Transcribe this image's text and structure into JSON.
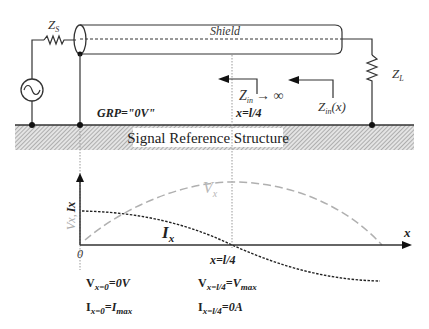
{
  "circuit": {
    "source_impedance_label": "Z",
    "source_impedance_sub": "S",
    "load_impedance_label": "Z",
    "load_impedance_sub": "L",
    "shield_label": "Shield",
    "ground_label": "GRP=\"0V\"",
    "reference_label": "Signal Reference Structure",
    "zin_inf_main": "Z",
    "zin_inf_sub": "in",
    "zin_inf_suffix": "→ ∞",
    "quarter_label": "x=l/4",
    "zin_x_main": "Z",
    "zin_x_sub": "in",
    "zin_x_suffix": "(x)"
  },
  "graph": {
    "y_axis_label_v": "Vx,",
    "y_axis_label_i": "Ix",
    "x_axis_label": "x",
    "origin_label": "0",
    "quarter_tick_label": "x=l/4",
    "curve_v_label_main": "V",
    "curve_v_label_sub": "x",
    "curve_i_label_main": "I",
    "curve_i_label_sub": "x",
    "colors": {
      "voltage_curve": "#b0b0b0",
      "current_curve": "#222222",
      "axis": "#333333"
    }
  },
  "equations": {
    "left": {
      "v_main": "V",
      "v_sub": "x=0",
      "v_rhs": "=0V",
      "i_main": "I",
      "i_sub": "x=0",
      "i_rhs_main": "=I",
      "i_rhs_sub": "max"
    },
    "right": {
      "v_main": "V",
      "v_sub": "x=l/4",
      "v_rhs_main": "=V",
      "v_rhs_sub": "max",
      "i_main": "I",
      "i_sub": "x=l/4",
      "i_rhs": "=0A"
    }
  }
}
